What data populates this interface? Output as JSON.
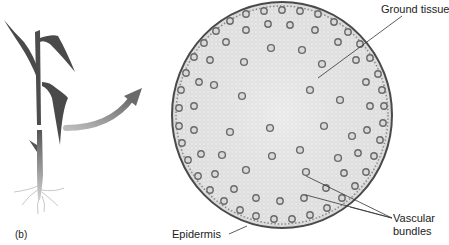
{
  "figure": {
    "panel_label": "(b)",
    "labels": {
      "ground_tissue": "Ground tissue",
      "epidermis": "Epidermis",
      "vascular_bundles_line1": "Vascular",
      "vascular_bundles_line2": "bundles"
    },
    "colors": {
      "plant": "#4a4a4a",
      "arrow": "#7a7a7a",
      "tissue_fill": "#e6e6e6",
      "epidermis_edge": "#3a3a3a",
      "bundle": "#6e6e6e",
      "leader_line": "#333333"
    }
  }
}
